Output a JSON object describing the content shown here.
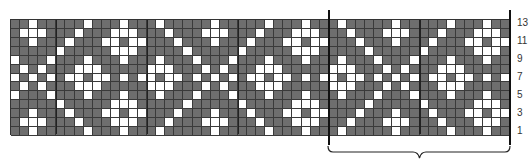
{
  "chart_data": {
    "type": "table",
    "title": "",
    "rows": 13,
    "columns": 55,
    "repeat_width": 20,
    "repeat_start_column": 35,
    "thick_line_columns": [
      5,
      15,
      25,
      35,
      45
    ],
    "colors": {
      "dark": "#6e6e6e",
      "light": "#ffffff",
      "gridline": "#3a3a3a"
    },
    "tile_rows_top_to_bottom": [
      "DDWDDDDDWDDDWDDDWDDD",
      "DWWWDDDWDDDWWWDDDWDD",
      "DDWDDDWDDDWWDWWDDDWD",
      "DDDDDWDDDDDWWWDDDDDW",
      "WDDDWDDDWDDDWDDDWDDD",
      "DWDWDDDWWWDDDDDWWWDD",
      "WDWDWDWWDWWDWDWWDWWD",
      "DWDWDDDWWWDDDDDWWWDD",
      "WDDDWDDDWDDDWDDDWDDD",
      "DDDDDWDDDDDWWWDDDDDW",
      "DDWDDDWDDDWWDWWDDDWD",
      "DWWWDDDWDDDWWWDDDWDD",
      "DDWDDDDDWDDDWDDDWDDD"
    ],
    "row_labels": [
      {
        "row_from_bottom": 13,
        "text": "13"
      },
      {
        "row_from_bottom": 11,
        "text": "11"
      },
      {
        "row_from_bottom": 9,
        "text": "9"
      },
      {
        "row_from_bottom": 7,
        "text": "7"
      },
      {
        "row_from_bottom": 5,
        "text": "5"
      },
      {
        "row_from_bottom": 3,
        "text": "3"
      },
      {
        "row_from_bottom": 1,
        "text": "1"
      }
    ]
  }
}
